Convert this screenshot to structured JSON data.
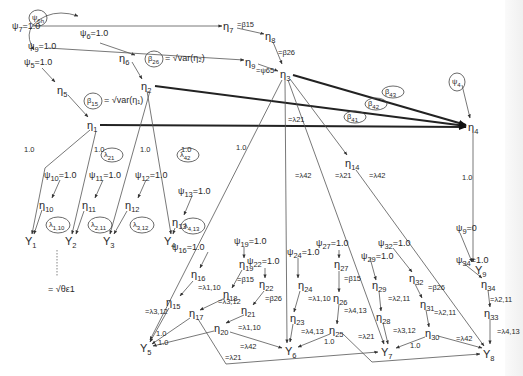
{
  "diagram": {
    "nodes": [
      {
        "id": "eta1",
        "main": "η",
        "sub": "1"
      },
      {
        "id": "eta2",
        "main": "η",
        "sub": "2"
      },
      {
        "id": "eta3",
        "main": "η",
        "sub": "3"
      },
      {
        "id": "eta4",
        "main": "η",
        "sub": "4"
      },
      {
        "id": "eta5",
        "main": "η",
        "sub": "5"
      },
      {
        "id": "eta6",
        "main": "η",
        "sub": "6"
      },
      {
        "id": "eta7",
        "main": "η",
        "sub": "7"
      },
      {
        "id": "eta8",
        "main": "η",
        "sub": "8"
      },
      {
        "id": "eta9",
        "main": "η",
        "sub": "9"
      },
      {
        "id": "eta10",
        "main": "η",
        "sub": "10"
      },
      {
        "id": "eta11",
        "main": "η",
        "sub": "11"
      },
      {
        "id": "eta12",
        "main": "η",
        "sub": "12"
      },
      {
        "id": "eta13",
        "main": "η",
        "sub": "13"
      },
      {
        "id": "eta14",
        "main": "η",
        "sub": "14"
      },
      {
        "id": "eta15",
        "main": "η",
        "sub": "15"
      },
      {
        "id": "eta16",
        "main": "η",
        "sub": "16"
      },
      {
        "id": "eta17",
        "main": "η",
        "sub": "17"
      },
      {
        "id": "eta18",
        "main": "η",
        "sub": "18"
      },
      {
        "id": "eta19",
        "main": "η",
        "sub": "19"
      },
      {
        "id": "eta20",
        "main": "η",
        "sub": "20"
      },
      {
        "id": "eta21",
        "main": "η",
        "sub": "21"
      },
      {
        "id": "eta22",
        "main": "η",
        "sub": "22"
      },
      {
        "id": "eta23",
        "main": "η",
        "sub": "23"
      },
      {
        "id": "eta24",
        "main": "η",
        "sub": "24"
      },
      {
        "id": "eta25",
        "main": "η",
        "sub": "25"
      },
      {
        "id": "eta26",
        "main": "η",
        "sub": "26"
      },
      {
        "id": "eta27",
        "main": "η",
        "sub": "27"
      },
      {
        "id": "eta28",
        "main": "η",
        "sub": "28"
      },
      {
        "id": "eta29",
        "main": "η",
        "sub": "29"
      },
      {
        "id": "eta30",
        "main": "η",
        "sub": "30"
      },
      {
        "id": "eta31",
        "main": "η",
        "sub": "31"
      },
      {
        "id": "eta32",
        "main": "η",
        "sub": "32"
      },
      {
        "id": "eta33",
        "main": "η",
        "sub": "33"
      },
      {
        "id": "eta34",
        "main": "η",
        "sub": "34"
      },
      {
        "id": "Y1",
        "main": "Y",
        "sub": "1"
      },
      {
        "id": "Y2",
        "main": "Y",
        "sub": "2"
      },
      {
        "id": "Y3",
        "main": "Y",
        "sub": "3"
      },
      {
        "id": "Y4",
        "main": "Y",
        "sub": "4"
      },
      {
        "id": "Y5",
        "main": "Y",
        "sub": "5"
      },
      {
        "id": "Y6",
        "main": "Y",
        "sub": "6"
      },
      {
        "id": "Y7",
        "main": "Y",
        "sub": "7"
      },
      {
        "id": "Y8",
        "main": "Y",
        "sub": "8"
      },
      {
        "id": "Y9",
        "main": "Y",
        "sub": "9"
      }
    ],
    "psi_labels": [
      {
        "id": "psi5",
        "main": "ψ",
        "sub": "5",
        "rest": "=1.0"
      },
      {
        "id": "psi6",
        "main": "ψ",
        "sub": "6",
        "rest": "=1.0"
      },
      {
        "id": "psi7",
        "main": "ψ",
        "sub": "7",
        "rest": "=1.0"
      },
      {
        "id": "psi9",
        "main": "ψ",
        "sub": "9",
        "rest": "=1.0"
      },
      {
        "id": "psi10",
        "main": "ψ",
        "sub": "10",
        "rest": "=1.0"
      },
      {
        "id": "psi11",
        "main": "ψ",
        "sub": "11",
        "rest": "=1.0"
      },
      {
        "id": "psi12",
        "main": "ψ",
        "sub": "12",
        "rest": "=1.0"
      },
      {
        "id": "psi13",
        "main": "ψ",
        "sub": "13",
        "rest": "=1.0"
      },
      {
        "id": "psi16",
        "main": "ψ",
        "sub": "16",
        "rest": "=1.0"
      },
      {
        "id": "psi19",
        "main": "ψ",
        "sub": "19",
        "rest": "=1.0"
      },
      {
        "id": "psi22",
        "main": "ψ",
        "sub": "22",
        "rest": "=1.0"
      },
      {
        "id": "psi24",
        "main": "ψ",
        "sub": "24",
        "rest": "=1.0"
      },
      {
        "id": "psi27",
        "main": "ψ",
        "sub": "27",
        "rest": "=1.0"
      },
      {
        "id": "psi29",
        "main": "ψ",
        "sub": "29",
        "rest": "=1.0"
      },
      {
        "id": "psi32",
        "main": "ψ",
        "sub": "32",
        "rest": "=1.0"
      },
      {
        "id": "psi34",
        "main": "ψ",
        "sub": "34",
        "rest": "=1.0"
      },
      {
        "id": "psi9b",
        "main": "ψ",
        "sub": "9",
        "rest": "=0"
      }
    ],
    "circled_params": [
      {
        "id": "psi6h",
        "main": "ψ",
        "sub": "6h"
      },
      {
        "id": "beta26",
        "main": "β",
        "sub": "26"
      },
      {
        "id": "beta15",
        "main": "β",
        "sub": "15"
      },
      {
        "id": "beta43",
        "main": "β",
        "sub": "43"
      },
      {
        "id": "beta42",
        "main": "β",
        "sub": "42"
      },
      {
        "id": "beta41",
        "main": "β",
        "sub": "41"
      },
      {
        "id": "psi4",
        "main": "ψ",
        "sub": "4"
      },
      {
        "id": "lambda21",
        "main": "λ",
        "sub": "21"
      },
      {
        "id": "lambda42",
        "main": "λ",
        "sub": "42"
      },
      {
        "id": "lambda110",
        "main": "λ",
        "sub": "1,10"
      },
      {
        "id": "lambda211",
        "main": "λ",
        "sub": "2,11"
      },
      {
        "id": "lambda312",
        "main": "λ",
        "sub": "3,12"
      },
      {
        "id": "lambda413",
        "main": "λ",
        "sub": "4,13"
      }
    ],
    "equations": {
      "beta26_eq": "= √var(η₂)",
      "beta15_eq": "= √var(η₁)",
      "theta_eq": "= √θε1"
    },
    "edge_labels": {
      "one": "1.0",
      "eq_beta15": "=β15",
      "eq_beta26": "=β26",
      "eq_psi65": "=ψ65",
      "eq_lambda21": "=λ21",
      "eq_lambda42": "=λ42",
      "eq_lambda110": "=λ1,10",
      "eq_lambda211": "=λ2,11",
      "eq_lambda312": "=λ3,12",
      "eq_lambda413": "=λ4,13"
    }
  }
}
